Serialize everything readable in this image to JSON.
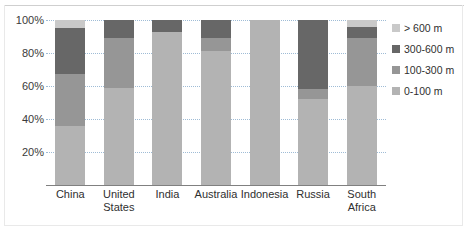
{
  "chart_data": {
    "type": "bar",
    "subtype": "stacked-percent",
    "title": "",
    "xlabel": "",
    "ylabel": "",
    "ylim": [
      0,
      100
    ],
    "yticks": [
      "20%",
      "40%",
      "60%",
      "80%",
      "100%"
    ],
    "ytick_values": [
      20,
      40,
      60,
      80,
      100
    ],
    "grid": true,
    "legend_position": "right",
    "categories": [
      "China",
      "United States",
      "India",
      "Australia",
      "Indonesia",
      "Russia",
      "South Africa"
    ],
    "category_lines": [
      [
        "China"
      ],
      [
        "United",
        "States"
      ],
      [
        "India"
      ],
      [
        "Australia"
      ],
      [
        "Indonesia"
      ],
      [
        "Russia"
      ],
      [
        "South",
        "Africa"
      ]
    ],
    "series": [
      {
        "name": "0-100 m",
        "color": "#b3b3b3",
        "values": [
          36,
          59,
          93,
          81,
          100,
          52,
          60
        ]
      },
      {
        "name": "100-300 m",
        "color": "#969696",
        "values": [
          31,
          30,
          0,
          8,
          0,
          6,
          29
        ]
      },
      {
        "name": "300-600 m",
        "color": "#676767",
        "values": [
          28,
          11,
          7,
          11,
          0,
          42,
          7
        ]
      },
      {
        "name": "> 600 m",
        "color": "#c9c9c9",
        "values": [
          5,
          0,
          0,
          0,
          0,
          0,
          4
        ]
      }
    ],
    "legend": [
      {
        "label": "> 600 m",
        "color": "#c9c9c9"
      },
      {
        "label": "300-600 m",
        "color": "#676767"
      },
      {
        "label": "100-300 m",
        "color": "#969696"
      },
      {
        "label": "0-100 m",
        "color": "#b3b3b3"
      }
    ],
    "colors": {
      "gridline": "#9fbcd6",
      "axis": "#808080",
      "text": "#2f2f2f",
      "background": "#ffffff"
    }
  }
}
